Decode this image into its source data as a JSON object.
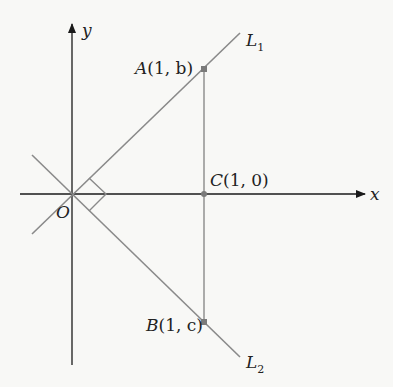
{
  "diagram": {
    "axes": {
      "x_label": "x",
      "y_label": "y",
      "origin_label": "O"
    },
    "lines": [
      {
        "name": "L",
        "subscript": "1"
      },
      {
        "name": "L",
        "subscript": "2"
      }
    ],
    "points": {
      "A": {
        "name": "A",
        "coords": "(1, b)"
      },
      "B": {
        "name": "B",
        "coords": "(1, c)"
      },
      "C": {
        "name": "C",
        "coords": "(1, 0)"
      }
    },
    "colors": {
      "axis": "#1a1a1a",
      "line": "#8a8a8a",
      "point": "#7a7a7a",
      "text": "#222222"
    }
  }
}
